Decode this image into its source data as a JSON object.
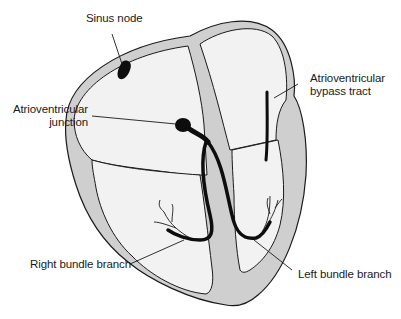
{
  "diagram": {
    "colors": {
      "outline": "#1a1a1a",
      "wall": "#cfcfcf",
      "chamber": "#f2f2f2",
      "conduction": "#0d0d0d"
    },
    "labels": {
      "sinus_node": "Sinus node",
      "av_junction_line1": "Atrioventricular",
      "av_junction_line2": "junction",
      "bypass_line1": "Atrioventricular",
      "bypass_line2": "bypass tract",
      "right_bundle": "Right bundle branch",
      "left_bundle": "Left bundle branch"
    }
  }
}
